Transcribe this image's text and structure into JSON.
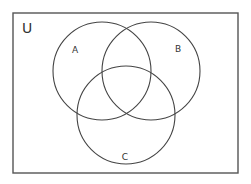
{
  "diagram": {
    "type": "venn",
    "universe": {
      "label": "U",
      "rect": {
        "x": 13,
        "y": 13,
        "width": 225,
        "height": 160
      },
      "stroke": "#555555"
    },
    "sets": [
      {
        "label": "A",
        "cx": 102,
        "cy": 71,
        "r": 49,
        "label_x": 75,
        "label_y": 53
      },
      {
        "label": "B",
        "cx": 151,
        "cy": 71,
        "r": 49,
        "label_x": 178,
        "label_y": 52
      },
      {
        "label": "C",
        "cx": 126,
        "cy": 115,
        "r": 49,
        "label_x": 125,
        "label_y": 160
      }
    ],
    "stroke": "#444444"
  }
}
